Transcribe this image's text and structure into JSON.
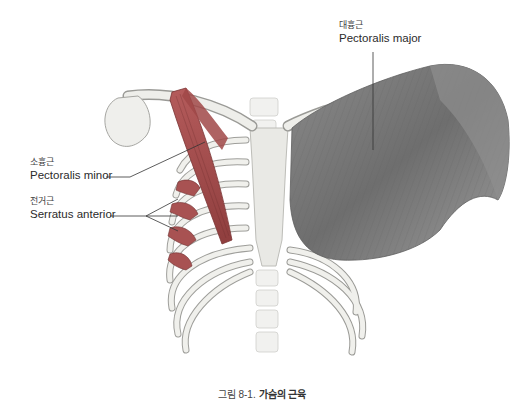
{
  "figure": {
    "caption_prefix": "그림 8-1.",
    "caption_title": "가슴의 근육",
    "labels": [
      {
        "id": "pectoralis-major",
        "ko": "대흉근",
        "en": "Pectoralis major"
      },
      {
        "id": "pectoralis-minor",
        "ko": "소흉근",
        "en": "Pectoralis minor"
      },
      {
        "id": "serratus-anterior",
        "ko": "전거근",
        "en": "Serratus anterior"
      }
    ],
    "colors": {
      "bone": "#efefec",
      "bone_outline": "#9a9a96",
      "pectoralis_major": "#7d7d7d",
      "pectoralis_minor": "#b04a4a",
      "serratus_anterior": "#a65050",
      "leader_line": "#333333"
    }
  }
}
